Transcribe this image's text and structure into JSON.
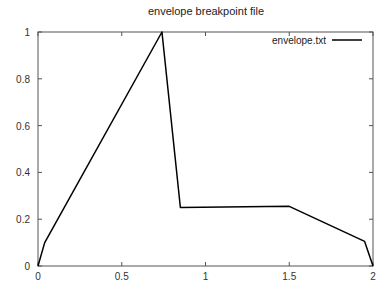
{
  "chart_data": {
    "type": "line",
    "title": "envelope breakpoint file",
    "xlabel": "",
    "ylabel": "",
    "xlim": [
      0,
      2
    ],
    "ylim": [
      0,
      1
    ],
    "xticks": [
      0,
      0.5,
      1,
      1.5,
      2
    ],
    "xtick_labels": [
      "0",
      "0.5",
      "1",
      "1.5",
      "2"
    ],
    "yticks": [
      0,
      0.2,
      0.4,
      0.6,
      0.8,
      1
    ],
    "ytick_labels": [
      "0",
      "0.2",
      "0.4",
      "0.6",
      "0.8",
      "1"
    ],
    "grid": false,
    "legend": {
      "position": "top-right",
      "entries": [
        "envelope.txt"
      ]
    },
    "series": [
      {
        "name": "envelope.txt",
        "color": "#000000",
        "x": [
          0,
          0.04,
          0.74,
          0.85,
          1.5,
          1.95,
          2.0
        ],
        "y": [
          0,
          0.1,
          1.0,
          0.25,
          0.255,
          0.105,
          0
        ]
      }
    ]
  }
}
